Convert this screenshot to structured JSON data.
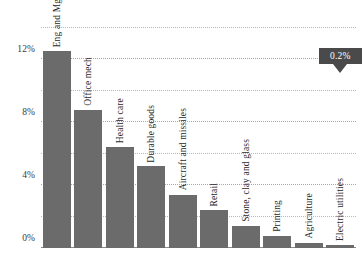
{
  "chart_data": {
    "type": "bar",
    "title": "",
    "subtitle": "",
    "xlabel": "",
    "ylabel": "",
    "ylim": [
      0,
      14.5
    ],
    "ytick_values": [
      0,
      4,
      8,
      12
    ],
    "ytick_labels": [
      "0%",
      "4%",
      "8%",
      "12%"
    ],
    "gridlines": {
      "visible": true,
      "style": "dotted",
      "y_values": [
        0,
        2,
        4,
        6,
        8,
        10,
        12,
        14
      ]
    },
    "legend": {
      "visible": false,
      "position": "none"
    },
    "bar_color": "#6b6b6b",
    "categories": [
      "Eng and Mgt Svcs",
      "Office mech",
      "Health care",
      "Durable goods",
      "Aircraft and missiles",
      "Retail",
      "Stone, clay and glass",
      "Printing",
      "Agriculture",
      "Electric utilities"
    ],
    "values": [
      12.5,
      8.8,
      6.4,
      5.2,
      3.4,
      2.4,
      1.4,
      0.75,
      0.35,
      0.2
    ],
    "annotations": [
      {
        "label": "0.2%",
        "target_category": "Electric utilities",
        "target_value": 0.2,
        "style": "callout-box-with-pointer",
        "background_color": "#4a4a4a",
        "text_color": "#ffffff"
      }
    ]
  }
}
